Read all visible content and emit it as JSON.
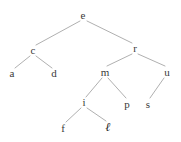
{
  "figure": {
    "kind": "binary-tree-diagram",
    "background_color": "#ffffff",
    "edge_color": "#b0b0b0",
    "label_color": "#3a3a3a",
    "highlight_label_color": "#1c1c1c",
    "width": 181,
    "height": 142
  },
  "nodes": [
    {
      "id": "e",
      "label": "e",
      "x": 83,
      "y": 15,
      "style": "normal"
    },
    {
      "id": "c",
      "label": "c",
      "x": 33,
      "y": 50,
      "style": "normal"
    },
    {
      "id": "r",
      "label": "r",
      "x": 135,
      "y": 48,
      "style": "normal"
    },
    {
      "id": "a",
      "label": "a",
      "x": 12,
      "y": 73,
      "style": "normal"
    },
    {
      "id": "d",
      "label": "d",
      "x": 54,
      "y": 73,
      "style": "normal"
    },
    {
      "id": "m",
      "label": "m",
      "x": 105,
      "y": 72,
      "style": "normal"
    },
    {
      "id": "u",
      "label": "u",
      "x": 167,
      "y": 72,
      "style": "normal"
    },
    {
      "id": "i",
      "label": "i",
      "x": 84,
      "y": 102,
      "style": "normal"
    },
    {
      "id": "p",
      "label": "p",
      "x": 127,
      "y": 104,
      "style": "normal"
    },
    {
      "id": "s",
      "label": "s",
      "x": 148,
      "y": 104,
      "style": "normal"
    },
    {
      "id": "f",
      "label": "f",
      "x": 63,
      "y": 128,
      "style": "normal"
    },
    {
      "id": "l",
      "label": "ℓ",
      "x": 108,
      "y": 127,
      "style": "script"
    }
  ],
  "edges": [
    {
      "from": "e",
      "to": "c",
      "x1": 80,
      "y1": 21,
      "x2": 36,
      "y2": 45
    },
    {
      "from": "e",
      "to": "r",
      "x1": 87,
      "y1": 21,
      "x2": 132,
      "y2": 43
    },
    {
      "from": "c",
      "to": "a",
      "x1": 30,
      "y1": 56,
      "x2": 15,
      "y2": 68
    },
    {
      "from": "c",
      "to": "d",
      "x1": 36,
      "y1": 56,
      "x2": 52,
      "y2": 68
    },
    {
      "from": "r",
      "to": "m",
      "x1": 132,
      "y1": 54,
      "x2": 107,
      "y2": 66
    },
    {
      "from": "r",
      "to": "u",
      "x1": 138,
      "y1": 54,
      "x2": 165,
      "y2": 66
    },
    {
      "from": "m",
      "to": "i",
      "x1": 102,
      "y1": 78,
      "x2": 86,
      "y2": 97
    },
    {
      "from": "m",
      "to": "p",
      "x1": 108,
      "y1": 78,
      "x2": 126,
      "y2": 98
    },
    {
      "from": "u",
      "to": "s",
      "x1": 164,
      "y1": 78,
      "x2": 150,
      "y2": 98
    },
    {
      "from": "i",
      "to": "f",
      "x1": 81,
      "y1": 108,
      "x2": 66,
      "y2": 122
    },
    {
      "from": "i",
      "to": "l",
      "x1": 87,
      "y1": 108,
      "x2": 106,
      "y2": 121
    }
  ]
}
